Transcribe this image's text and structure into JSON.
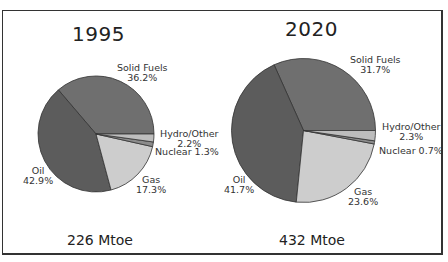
{
  "chart_data": [
    {
      "type": "pie",
      "title": "1995",
      "total_label": "226 Mtoe",
      "categories": [
        "Solid Fuels",
        "Oil",
        "Gas",
        "Nuclear",
        "Hydro/Other"
      ],
      "values": [
        36.2,
        42.9,
        17.3,
        1.3,
        2.2
      ],
      "value_labels": [
        "36.2%",
        "42.9%",
        "17.3%",
        "1.3%",
        "2.2%"
      ],
      "colors": [
        "#6f6f6f",
        "#5c5c5c",
        "#cdcdcd",
        "#8c8c8c",
        "#bdbdbd"
      ]
    },
    {
      "type": "pie",
      "title": "2020",
      "total_label": "432 Mtoe",
      "categories": [
        "Solid Fuels",
        "Oil",
        "Gas",
        "Nuclear",
        "Hydro/Other"
      ],
      "values": [
        31.7,
        41.7,
        23.6,
        0.7,
        2.3
      ],
      "value_labels": [
        "31.7%",
        "41.7%",
        "23.6%",
        "0.7%",
        "2.3%"
      ],
      "colors": [
        "#6f6f6f",
        "#5c5c5c",
        "#cdcdcd",
        "#8c8c8c",
        "#bdbdbd"
      ]
    }
  ],
  "labels": {
    "p1": {
      "title": "1995",
      "solid": "Solid Fuels",
      "solid_v": "36.2%",
      "hydro": "Hydro/Other",
      "hydro_v": "2.2%",
      "nuclear": "Nuclear  1.3%",
      "gas": "Gas",
      "gas_v": "17.3%",
      "oil": "Oil",
      "oil_v": "42.9%",
      "total": "226 Mtoe"
    },
    "p2": {
      "title": "2020",
      "solid": "Solid Fuels",
      "solid_v": "31.7%",
      "hydro": "Hydro/Other",
      "hydro_v": "2.3%",
      "nuclear": "Nuclear  0.7%",
      "gas": "Gas",
      "gas_v": "23.6%",
      "oil": "Oil",
      "oil_v": "41.7%",
      "total": "432 Mtoe"
    }
  }
}
